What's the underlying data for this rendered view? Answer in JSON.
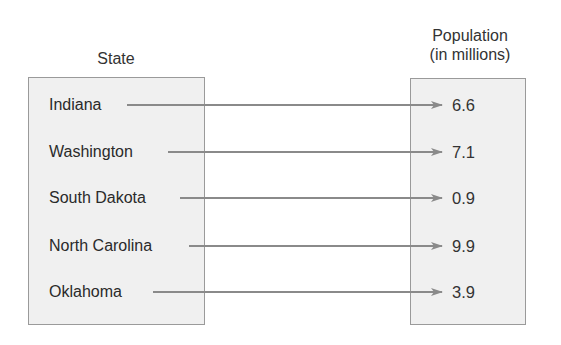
{
  "diagram": {
    "type": "mapping",
    "domain_header": "State",
    "range_header_line1": "Population",
    "range_header_line2": "(in millions)",
    "rows": [
      {
        "state": "Indiana",
        "population": "6.6"
      },
      {
        "state": "Washington",
        "population": "7.1"
      },
      {
        "state": "South Dakota",
        "population": "0.9"
      },
      {
        "state": "North Carolina",
        "population": "9.9"
      },
      {
        "state": "Oklahoma",
        "population": "3.9"
      }
    ],
    "colors": {
      "box_fill": "#f0f0f0",
      "box_border": "#9a9a9a",
      "arrow": "#8a8a8a",
      "text": "#2a2a2a"
    }
  }
}
